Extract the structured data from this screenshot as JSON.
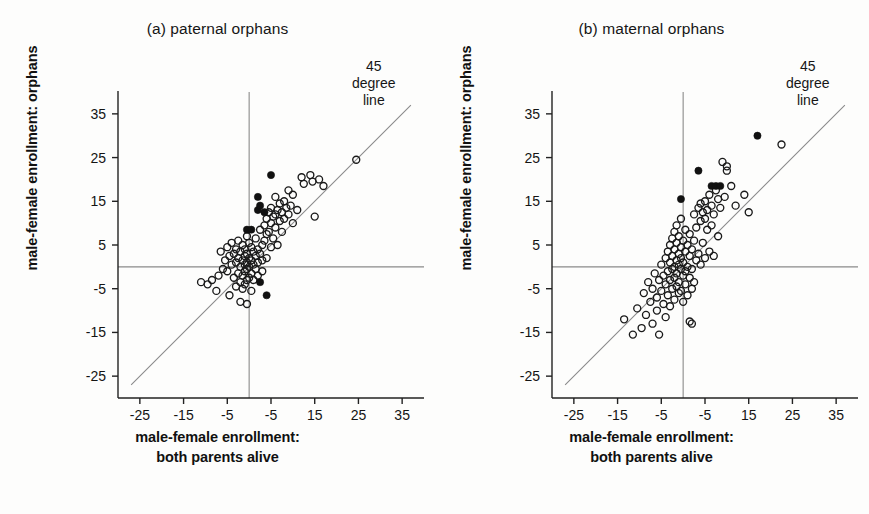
{
  "figure": {
    "background": "#fdfdfc",
    "axis_color": "#222222",
    "guide_color": "#8a8a8a",
    "marker_open_stroke": "#1a1a1a",
    "marker_filled_fill": "#111111"
  },
  "shared": {
    "ylabel": "male-female enrollment: orphans",
    "xlabel_line1": "male-female enrollment:",
    "xlabel_line2": "both parents alive",
    "annotation_line1": "45",
    "annotation_line2": "degree",
    "annotation_line3": "line",
    "y_ticks": [
      "35",
      "25",
      "15",
      "5",
      "-5",
      "-15",
      "-25"
    ],
    "x_ticks": [
      "-25",
      "-15",
      "-5",
      "-5",
      "15",
      "25",
      "35"
    ]
  },
  "chart_data": [
    {
      "type": "scatter",
      "title": "(a) paternal orphans",
      "xlabel": "male-female enrollment: both parents alive",
      "ylabel": "male-female enrollment: orphans",
      "xlim": [
        -30,
        40
      ],
      "ylim": [
        -30,
        40
      ],
      "x_tick_values": [
        -25,
        -15,
        -5,
        5,
        15,
        25,
        35
      ],
      "y_tick_values": [
        -25,
        -15,
        -5,
        5,
        15,
        25,
        35
      ],
      "x_tick_labels": [
        "-25",
        "-15",
        "-5",
        "-5",
        "15",
        "25",
        "35"
      ],
      "y_tick_labels": [
        "-25",
        "-15",
        "-5",
        "5",
        "15",
        "25",
        "35"
      ],
      "grid": false,
      "legend": null,
      "reference_lines": [
        {
          "name": "45-degree-line",
          "type": "diagonal",
          "from": [
            -27,
            -27
          ],
          "to": [
            37,
            37
          ]
        },
        {
          "name": "zero-horizontal",
          "type": "horizontal",
          "value": 0
        },
        {
          "name": "zero-vertical",
          "type": "vertical",
          "value": 0
        }
      ],
      "annotations": [
        {
          "text": "45 degree line",
          "x": 30,
          "y": 38
        }
      ],
      "series": [
        {
          "name": "open-circles",
          "marker": "open",
          "points": [
            [
              -11.0,
              -3.5
            ],
            [
              -9.5,
              -4.0
            ],
            [
              -8.5,
              -3.0
            ],
            [
              -7.5,
              -5.5
            ],
            [
              -7.0,
              -2.0
            ],
            [
              -6.5,
              3.5
            ],
            [
              -6.0,
              -0.5
            ],
            [
              -5.5,
              1.5
            ],
            [
              -5.0,
              4.5
            ],
            [
              -5.0,
              -1.0
            ],
            [
              -4.5,
              2.5
            ],
            [
              -4.5,
              -6.5
            ],
            [
              -4.0,
              5.5
            ],
            [
              -4.0,
              0.5
            ],
            [
              -3.5,
              3.0
            ],
            [
              -3.5,
              -2.5
            ],
            [
              -3.0,
              4.0
            ],
            [
              -3.0,
              1.0
            ],
            [
              -3.0,
              -4.5
            ],
            [
              -2.5,
              6.0
            ],
            [
              -2.5,
              2.0
            ],
            [
              -2.5,
              -1.5
            ],
            [
              -2.0,
              3.5
            ],
            [
              -2.0,
              0.0
            ],
            [
              -2.0,
              -3.5
            ],
            [
              -2.0,
              -8.0
            ],
            [
              -1.5,
              5.0
            ],
            [
              -1.5,
              1.5
            ],
            [
              -1.5,
              -2.0
            ],
            [
              -1.5,
              -5.0
            ],
            [
              -1.0,
              4.0
            ],
            [
              -1.0,
              2.5
            ],
            [
              -1.0,
              0.5
            ],
            [
              -1.0,
              -1.0
            ],
            [
              -1.0,
              -4.0
            ],
            [
              -0.5,
              7.0
            ],
            [
              -0.5,
              3.0
            ],
            [
              -0.5,
              1.0
            ],
            [
              -0.5,
              -0.5
            ],
            [
              -0.5,
              -3.0
            ],
            [
              -0.5,
              -8.5
            ],
            [
              0.0,
              5.5
            ],
            [
              0.0,
              2.0
            ],
            [
              0.0,
              0.0
            ],
            [
              0.0,
              -2.5
            ],
            [
              0.5,
              4.5
            ],
            [
              0.5,
              1.5
            ],
            [
              0.5,
              -1.5
            ],
            [
              0.5,
              -5.5
            ],
            [
              1.0,
              3.5
            ],
            [
              1.0,
              0.5
            ],
            [
              1.0,
              -3.0
            ],
            [
              1.5,
              6.5
            ],
            [
              1.5,
              2.5
            ],
            [
              1.5,
              -0.5
            ],
            [
              2.0,
              4.0
            ],
            [
              2.0,
              1.0
            ],
            [
              2.0,
              -2.0
            ],
            [
              2.5,
              8.5
            ],
            [
              2.5,
              3.0
            ],
            [
              3.0,
              5.0
            ],
            [
              3.0,
              1.5
            ],
            [
              3.0,
              -1.0
            ],
            [
              3.5,
              9.5
            ],
            [
              3.5,
              6.0
            ],
            [
              4.0,
              11.0
            ],
            [
              4.0,
              7.5
            ],
            [
              4.0,
              2.0
            ],
            [
              4.5,
              12.5
            ],
            [
              4.5,
              8.0
            ],
            [
              5.0,
              13.5
            ],
            [
              5.0,
              10.0
            ],
            [
              5.0,
              4.5
            ],
            [
              5.5,
              11.5
            ],
            [
              5.5,
              6.5
            ],
            [
              6.0,
              16.0
            ],
            [
              6.0,
              12.0
            ],
            [
              6.0,
              9.0
            ],
            [
              6.5,
              13.0
            ],
            [
              6.5,
              5.0
            ],
            [
              7.0,
              14.5
            ],
            [
              7.0,
              10.5
            ],
            [
              7.5,
              12.5
            ],
            [
              7.5,
              8.0
            ],
            [
              8.0,
              15.0
            ],
            [
              8.0,
              11.0
            ],
            [
              8.5,
              13.5
            ],
            [
              9.0,
              17.5
            ],
            [
              9.0,
              12.0
            ],
            [
              9.5,
              14.0
            ],
            [
              10.0,
              16.5
            ],
            [
              10.0,
              10.0
            ],
            [
              11.0,
              13.0
            ],
            [
              12.0,
              20.5
            ],
            [
              12.5,
              19.0
            ],
            [
              14.0,
              21.0
            ],
            [
              14.5,
              19.5
            ],
            [
              15.0,
              11.5
            ],
            [
              16.0,
              20.0
            ],
            [
              17.0,
              18.5
            ],
            [
              24.5,
              24.5
            ]
          ]
        },
        {
          "name": "filled-circles",
          "marker": "filled",
          "points": [
            [
              -0.5,
              8.5
            ],
            [
              0.5,
              8.5
            ],
            [
              2.0,
              13.0
            ],
            [
              2.5,
              14.0
            ],
            [
              2.0,
              16.0
            ],
            [
              5.0,
              21.0
            ],
            [
              3.5,
              12.5
            ],
            [
              2.5,
              -3.5
            ],
            [
              4.0,
              -6.5
            ]
          ]
        }
      ]
    },
    {
      "type": "scatter",
      "title": "(b) maternal orphans",
      "xlabel": "male-female enrollment: both parents alive",
      "ylabel": "male-female enrollment: orphans",
      "xlim": [
        -30,
        40
      ],
      "ylim": [
        -30,
        40
      ],
      "x_tick_values": [
        -25,
        -15,
        -5,
        5,
        15,
        25,
        35
      ],
      "y_tick_values": [
        -25,
        -15,
        -5,
        5,
        15,
        25,
        35
      ],
      "x_tick_labels": [
        "-25",
        "-15",
        "-5",
        "-5",
        "15",
        "25",
        "35"
      ],
      "y_tick_labels": [
        "-25",
        "-15",
        "-5",
        "5",
        "15",
        "25",
        "35"
      ],
      "grid": false,
      "legend": null,
      "reference_lines": [
        {
          "name": "45-degree-line",
          "type": "diagonal",
          "from": [
            -27,
            -27
          ],
          "to": [
            37,
            37
          ]
        },
        {
          "name": "zero-horizontal",
          "type": "horizontal",
          "value": 0
        },
        {
          "name": "zero-vertical",
          "type": "vertical",
          "value": 0
        }
      ],
      "annotations": [
        {
          "text": "45 degree line",
          "x": 30,
          "y": 38
        }
      ],
      "series": [
        {
          "name": "open-circles",
          "marker": "open",
          "points": [
            [
              -13.5,
              -12.0
            ],
            [
              -11.5,
              -15.5
            ],
            [
              -10.5,
              -9.5
            ],
            [
              -9.5,
              -14.0
            ],
            [
              -9.0,
              -6.0
            ],
            [
              -8.5,
              -11.0
            ],
            [
              -8.0,
              -3.5
            ],
            [
              -7.5,
              -8.0
            ],
            [
              -7.0,
              -13.0
            ],
            [
              -7.0,
              -5.0
            ],
            [
              -6.5,
              -1.5
            ],
            [
              -6.0,
              -7.0
            ],
            [
              -6.0,
              -10.0
            ],
            [
              -5.5,
              -3.0
            ],
            [
              -5.5,
              -15.5
            ],
            [
              -5.0,
              0.5
            ],
            [
              -5.0,
              -5.5
            ],
            [
              -4.5,
              -2.0
            ],
            [
              -4.5,
              -8.5
            ],
            [
              -4.0,
              2.0
            ],
            [
              -4.0,
              -4.0
            ],
            [
              -4.0,
              -11.5
            ],
            [
              -3.5,
              3.5
            ],
            [
              -3.5,
              -1.0
            ],
            [
              -3.5,
              -6.5
            ],
            [
              -3.0,
              5.0
            ],
            [
              -3.0,
              1.0
            ],
            [
              -3.0,
              -3.0
            ],
            [
              -3.0,
              -9.0
            ],
            [
              -2.5,
              6.5
            ],
            [
              -2.5,
              2.5
            ],
            [
              -2.5,
              -0.5
            ],
            [
              -2.5,
              -5.0
            ],
            [
              -2.0,
              8.0
            ],
            [
              -2.0,
              4.0
            ],
            [
              -2.0,
              0.0
            ],
            [
              -2.0,
              -2.5
            ],
            [
              -2.0,
              -7.5
            ],
            [
              -1.5,
              9.5
            ],
            [
              -1.5,
              5.5
            ],
            [
              -1.5,
              1.5
            ],
            [
              -1.5,
              -1.5
            ],
            [
              -1.5,
              -4.5
            ],
            [
              -1.0,
              7.0
            ],
            [
              -1.0,
              3.0
            ],
            [
              -1.0,
              0.5
            ],
            [
              -1.0,
              -3.5
            ],
            [
              -1.0,
              -6.0
            ],
            [
              -0.5,
              11.0
            ],
            [
              -0.5,
              4.5
            ],
            [
              -0.5,
              2.0
            ],
            [
              -0.5,
              -0.5
            ],
            [
              -0.5,
              -5.5
            ],
            [
              0.0,
              6.0
            ],
            [
              0.0,
              1.0
            ],
            [
              0.0,
              -2.0
            ],
            [
              0.0,
              -8.0
            ],
            [
              0.5,
              8.5
            ],
            [
              0.5,
              3.5
            ],
            [
              0.5,
              -1.0
            ],
            [
              0.5,
              -4.0
            ],
            [
              1.0,
              5.0
            ],
            [
              1.0,
              0.0
            ],
            [
              1.0,
              -6.5
            ],
            [
              1.5,
              7.5
            ],
            [
              1.5,
              2.5
            ],
            [
              1.5,
              -2.5
            ],
            [
              1.5,
              -12.5
            ],
            [
              2.0,
              4.0
            ],
            [
              2.0,
              -0.5
            ],
            [
              2.0,
              -5.0
            ],
            [
              2.0,
              -13.0
            ],
            [
              2.5,
              12.0
            ],
            [
              2.5,
              6.0
            ],
            [
              2.5,
              -3.5
            ],
            [
              3.0,
              9.0
            ],
            [
              3.0,
              1.5
            ],
            [
              3.5,
              13.5
            ],
            [
              3.5,
              3.0
            ],
            [
              4.0,
              14.5
            ],
            [
              4.0,
              10.5
            ],
            [
              4.0,
              0.5
            ],
            [
              4.5,
              12.5
            ],
            [
              4.5,
              5.5
            ],
            [
              5.0,
              15.0
            ],
            [
              5.0,
              11.0
            ],
            [
              5.0,
              2.0
            ],
            [
              5.5,
              13.0
            ],
            [
              5.5,
              8.5
            ],
            [
              6.0,
              16.5
            ],
            [
              6.0,
              3.5
            ],
            [
              6.5,
              14.0
            ],
            [
              6.5,
              9.5
            ],
            [
              7.0,
              12.0
            ],
            [
              7.0,
              2.5
            ],
            [
              7.5,
              17.5
            ],
            [
              8.0,
              15.5
            ],
            [
              8.0,
              7.0
            ],
            [
              8.5,
              13.5
            ],
            [
              9.0,
              24.0
            ],
            [
              9.5,
              16.0
            ],
            [
              10.0,
              23.0
            ],
            [
              10.0,
              22.0
            ],
            [
              11.0,
              18.5
            ],
            [
              12.0,
              14.0
            ],
            [
              14.0,
              16.5
            ],
            [
              15.0,
              12.5
            ],
            [
              22.5,
              28.0
            ]
          ]
        },
        {
          "name": "filled-circles",
          "marker": "filled",
          "points": [
            [
              -0.5,
              15.5
            ],
            [
              3.5,
              22.0
            ],
            [
              6.5,
              18.5
            ],
            [
              7.5,
              18.5
            ],
            [
              8.5,
              18.5
            ],
            [
              17.0,
              30.0
            ]
          ]
        }
      ]
    }
  ]
}
